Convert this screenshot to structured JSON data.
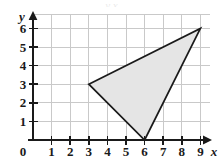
{
  "figure": {
    "background_color": "#ffffff",
    "axis_color": "#1a1a1a",
    "grid_color": "#c9c9c9",
    "shape_fill_color": "#e5e5e5",
    "shape_stroke_color": "#1a1a1a",
    "clipped_caption": "y                x"
  },
  "axes": {
    "x_axis_name": "x",
    "y_axis_name": "y",
    "origin_label": "0",
    "x_tick_labels": [
      "1",
      "2",
      "3",
      "4",
      "5",
      "6",
      "7",
      "8",
      "9"
    ],
    "y_tick_labels": [
      "1",
      "2",
      "3",
      "4",
      "5",
      "6"
    ]
  },
  "chart_data": {
    "type": "scatter",
    "title": "",
    "subtitle": "",
    "xlabel": "x",
    "ylabel": "y",
    "xlim": [
      0,
      9
    ],
    "ylim": [
      0,
      6
    ],
    "xticks": [
      0,
      1,
      2,
      3,
      4,
      5,
      6,
      7,
      8,
      9
    ],
    "yticks": [
      0,
      1,
      2,
      3,
      4,
      5,
      6
    ],
    "grid": true,
    "legend": null,
    "legend_position": "none",
    "annotations": [],
    "series": [
      {
        "name": "triangle",
        "kind": "polygon",
        "closed": true,
        "fill": "#e5e5e5",
        "stroke": "#1a1a1a",
        "vertices": [
          {
            "label": "A",
            "x": 3,
            "y": 3
          },
          {
            "label": "B",
            "x": 9,
            "y": 6
          },
          {
            "label": "C",
            "x": 6,
            "y": 0
          }
        ],
        "x": [
          3,
          9,
          6
        ],
        "y": [
          3,
          6,
          0
        ]
      }
    ]
  }
}
